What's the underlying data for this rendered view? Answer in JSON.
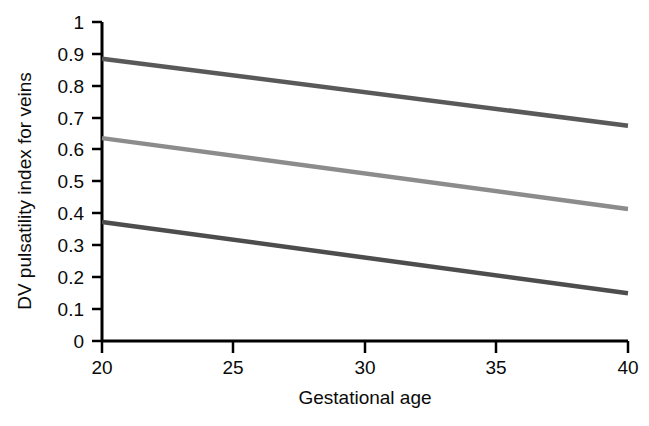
{
  "chart_data": {
    "type": "line",
    "title": "",
    "xlabel": "Gestational age",
    "ylabel": "DV pulsatility index for veins",
    "xlim": [
      20,
      40
    ],
    "ylim": [
      0,
      1
    ],
    "grid": false,
    "legend": "none",
    "x_ticks": [
      "20",
      "25",
      "30",
      "35",
      "40"
    ],
    "x_tick_values": [
      20,
      25,
      30,
      35,
      40
    ],
    "y_ticks": [
      "0",
      "0.1",
      "0.2",
      "0.3",
      "0.4",
      "0.5",
      "0.6",
      "0.7",
      "0.8",
      "0.9",
      "1"
    ],
    "y_tick_values": [
      0,
      0.1,
      0.2,
      0.3,
      0.4,
      0.5,
      0.6,
      0.7,
      0.8,
      0.9,
      1
    ],
    "x": [
      20,
      40
    ],
    "series": [
      {
        "name": "upper-reference-line",
        "values": [
          0.885,
          0.675
        ],
        "color": "#595959"
      },
      {
        "name": "median-reference-line",
        "values": [
          0.636,
          0.414
        ],
        "color": "#8c8c8c"
      },
      {
        "name": "lower-reference-line",
        "values": [
          0.373,
          0.15
        ],
        "color": "#4d4d4d"
      }
    ],
    "axis_color": "#000000",
    "background_color": "#ffffff"
  },
  "axes": {
    "x_title": "Gestational age",
    "y_title": "DV pulsatility index for veins"
  },
  "y_tick_labels": [
    "1",
    "0.9",
    "0.8",
    "0.7",
    "0.6",
    "0.5",
    "0.4",
    "0.3",
    "0.2",
    "0.1",
    "0"
  ],
  "x_tick_labels": [
    "20",
    "25",
    "30",
    "35",
    "40"
  ]
}
